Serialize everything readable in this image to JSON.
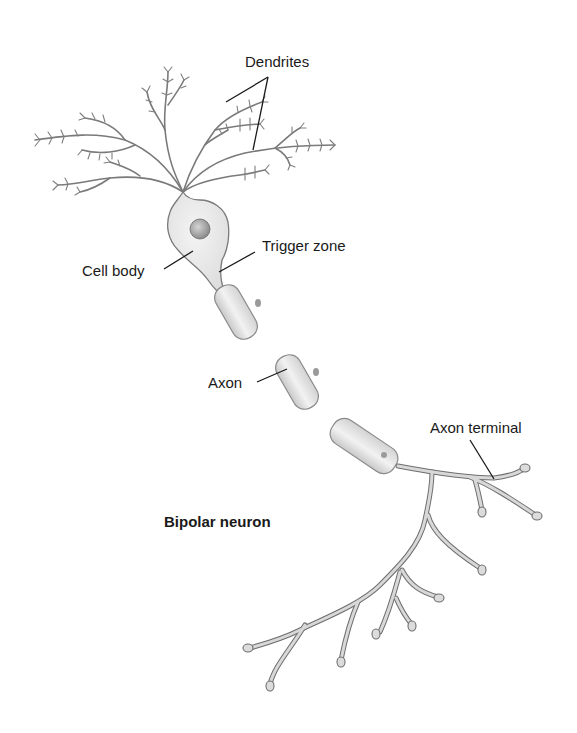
{
  "diagram": {
    "title": "Bipolar neuron",
    "labels": {
      "dendrites": "Dendrites",
      "cell_body": "Cell body",
      "trigger_zone": "Trigger zone",
      "axon": "Axon",
      "axon_terminal": "Axon terminal"
    },
    "colors": {
      "background": "#ffffff",
      "text": "#1a1a1a",
      "outline": "#7a7a7a",
      "cell_fill": "#e6e6e6",
      "nucleus": "#9a9a9a"
    }
  }
}
